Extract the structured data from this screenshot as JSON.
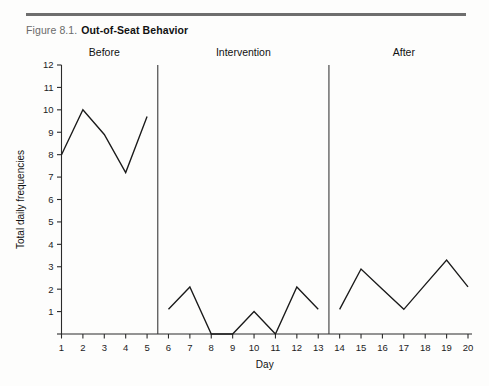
{
  "figure": {
    "number": "Figure 8.1.",
    "title": "Out-of-Seat Behavior"
  },
  "chart_data": {
    "type": "line",
    "title": "Out-of-Seat Behavior",
    "xlabel": "Day",
    "ylabel": "Total daily frequencies",
    "xlim": [
      1,
      20
    ],
    "ylim": [
      0,
      12
    ],
    "grid": false,
    "legend": "none",
    "x_ticks": [
      1,
      2,
      3,
      4,
      5,
      6,
      7,
      8,
      9,
      10,
      11,
      12,
      13,
      14,
      15,
      16,
      17,
      18,
      19,
      20
    ],
    "y_ticks": [
      0,
      1,
      2,
      3,
      4,
      5,
      6,
      7,
      8,
      9,
      10,
      11,
      12
    ],
    "phases": [
      {
        "name": "Before",
        "x_start": 1,
        "x_end": 5,
        "label": "Before"
      },
      {
        "name": "Intervention",
        "x_start": 6,
        "x_end": 13,
        "label": "Intervention"
      },
      {
        "name": "After",
        "x_start": 14,
        "x_end": 20,
        "label": "After"
      }
    ],
    "phase_dividers": [
      5.5,
      13.5
    ],
    "series": [
      {
        "name": "Before",
        "x": [
          1,
          2,
          3,
          4,
          5
        ],
        "values": [
          8.0,
          10.0,
          8.9,
          7.2,
          9.7
        ]
      },
      {
        "name": "Intervention",
        "x": [
          6,
          7,
          8,
          9,
          10,
          11,
          12,
          13
        ],
        "values": [
          1.1,
          2.1,
          0.0,
          0.0,
          1.0,
          0.0,
          2.1,
          1.1
        ]
      },
      {
        "name": "After",
        "x": [
          14,
          15,
          16,
          17,
          18,
          19,
          20
        ],
        "values": [
          1.1,
          2.9,
          2.0,
          1.1,
          2.2,
          3.3,
          2.1
        ]
      }
    ]
  }
}
